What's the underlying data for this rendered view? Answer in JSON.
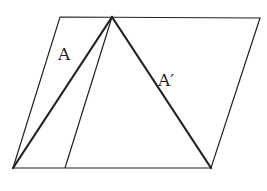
{
  "diagram": {
    "type": "geometry",
    "stroke_color": "#222222",
    "background": "#ffffff",
    "parallelogram": {
      "points": [
        [
          60,
          17
        ],
        [
          260,
          18
        ],
        [
          211,
          168
        ],
        [
          13,
          168
        ]
      ],
      "stroke_width": 1.2
    },
    "triangle": {
      "apex": [
        112,
        17
      ],
      "base_left": [
        13,
        168
      ],
      "base_right": [
        211,
        168
      ],
      "stroke_width": 2.2
    },
    "parallel_line": {
      "from": [
        112,
        17
      ],
      "to": [
        65,
        168
      ],
      "stroke_width": 1.2
    },
    "labels": [
      {
        "id": "A",
        "text": "A",
        "x": 58,
        "y": 60
      },
      {
        "id": "A-prime",
        "text": "A′",
        "x": 158,
        "y": 86
      }
    ]
  }
}
